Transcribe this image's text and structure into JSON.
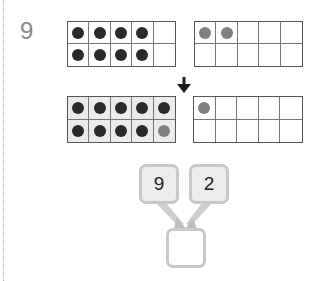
{
  "problem": {
    "number": "9"
  },
  "frames": {
    "top_left": {
      "filled": 9,
      "dot_color": "#2a2a2a",
      "dots": [
        "#2a2a2a",
        "#2a2a2a",
        "#2a2a2a",
        "#2a2a2a",
        null,
        "#2a2a2a",
        "#2a2a2a",
        "#2a2a2a",
        "#2a2a2a",
        null
      ],
      "shaded": false
    },
    "top_right": {
      "filled": 2,
      "dots": [
        "#808080",
        "#808080",
        null,
        null,
        null,
        null,
        null,
        null,
        null,
        null
      ],
      "shaded": false
    },
    "bottom_left": {
      "filled": 10,
      "dots": [
        "#2a2a2a",
        "#2a2a2a",
        "#2a2a2a",
        "#2a2a2a",
        "#2a2a2a",
        "#2a2a2a",
        "#2a2a2a",
        "#2a2a2a",
        "#2a2a2a",
        "#808080"
      ],
      "shaded": true
    },
    "bottom_right": {
      "filled": 1,
      "dots": [
        "#808080",
        null,
        null,
        null,
        null,
        null,
        null,
        null,
        null,
        null
      ],
      "shaded": false
    }
  },
  "number_bond": {
    "left_value": "9",
    "right_value": "2",
    "answer_value": ""
  },
  "colors": {
    "dark_dot": "#2a2a2a",
    "gray_dot": "#808080",
    "frame_line": "#555555",
    "box_border": "#c8c8c8",
    "box_fill": "#ececec"
  }
}
